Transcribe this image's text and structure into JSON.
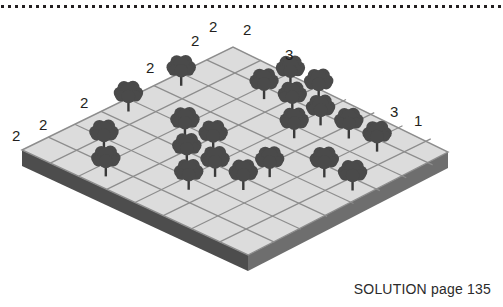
{
  "page": {
    "background": "#ffffff",
    "width": 503,
    "height": 307
  },
  "divider": {
    "style": "square-dotted",
    "color": "#231f20",
    "dot_size": 3,
    "dot_gap": 4,
    "y": 6
  },
  "board": {
    "type": "isometric-grid",
    "rows": 8,
    "cols": 8,
    "top_face_color": "#dcdcdc",
    "grid_line_color": "#8d8d8d",
    "left_side_color": "#4d4d4d",
    "right_side_color": "#6e6e6e",
    "corners": {
      "left": [
        22,
        150
      ],
      "top": [
        233,
        47
      ],
      "right": [
        448,
        152
      ],
      "bottom": [
        248,
        255
      ]
    },
    "thickness": 16
  },
  "tree": {
    "canopy_color": "#4a4a4a",
    "trunk_color": "#3a3a3a",
    "label": "tree"
  },
  "trees": [
    {
      "r": 0,
      "c": 3
    },
    {
      "r": 0,
      "c": 5
    },
    {
      "r": 1,
      "c": 1
    },
    {
      "r": 2,
      "c": 0
    },
    {
      "r": 2,
      "c": 3
    },
    {
      "r": 2,
      "c": 6
    },
    {
      "r": 3,
      "c": 2
    },
    {
      "r": 3,
      "c": 3
    },
    {
      "r": 3,
      "c": 6
    },
    {
      "r": 3,
      "c": 7
    },
    {
      "r": 4,
      "c": 1
    },
    {
      "r": 4,
      "c": 2
    },
    {
      "r": 4,
      "c": 5
    },
    {
      "r": 4,
      "c": 6
    },
    {
      "r": 5,
      "c": 2
    },
    {
      "r": 5,
      "c": 3
    },
    {
      "r": 5,
      "c": 6
    },
    {
      "r": 6,
      "c": 6
    },
    {
      "r": 6,
      "c": 4
    },
    {
      "r": 7,
      "c": 4
    },
    {
      "r": 2,
      "c": 7
    }
  ],
  "clues": [
    {
      "value": "2",
      "x": 12,
      "y": 128,
      "name": "clue-left-outer"
    },
    {
      "value": "2",
      "x": 39,
      "y": 117,
      "name": "clue-left-2"
    },
    {
      "value": "2",
      "x": 80,
      "y": 95,
      "name": "clue-left-3"
    },
    {
      "value": "2",
      "x": 146,
      "y": 60,
      "name": "clue-top-left-1"
    },
    {
      "value": "2",
      "x": 191,
      "y": 33,
      "name": "clue-top-peak-left"
    },
    {
      "value": "2",
      "x": 209,
      "y": 19,
      "name": "clue-top-peak-mid"
    },
    {
      "value": "2",
      "x": 243,
      "y": 22,
      "name": "clue-top-peak-right"
    },
    {
      "value": "3",
      "x": 285,
      "y": 47,
      "name": "clue-top-right-1"
    },
    {
      "value": "3",
      "x": 390,
      "y": 104,
      "name": "clue-right-1"
    },
    {
      "value": "1",
      "x": 414,
      "y": 113,
      "name": "clue-right-2"
    }
  ],
  "solution": {
    "text": "SOLUTION page 135"
  }
}
